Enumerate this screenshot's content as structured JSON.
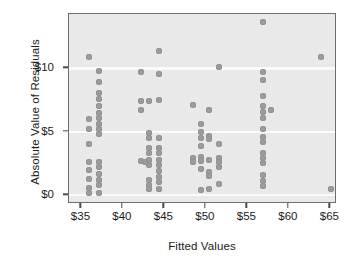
{
  "chart_data": {
    "type": "scatter",
    "title": "",
    "xlabel": "Fitted Values",
    "ylabel": "Absolute Value of Residuals",
    "xlim": [
      33.5,
      65.8
    ],
    "ylim": [
      -0.7,
      14.3
    ],
    "xticks": [
      35,
      40,
      45,
      50,
      55,
      60,
      65
    ],
    "xtick_labels": [
      "$35",
      "$40",
      "$45",
      "$50",
      "$55",
      "$60",
      "$65"
    ],
    "yticks": [
      0,
      5,
      10
    ],
    "ytick_labels": [
      "$0",
      "$5",
      "$10"
    ],
    "grid": "horizontal-white-on-gray",
    "legend": "none",
    "marker_color": "#9b9b9b",
    "plot_bg_color": "#e9e9e9",
    "frame_color": "#6d6d6d",
    "gridline_color": "#fbfbfb",
    "points": [
      [
        35.9,
        10.9
      ],
      [
        35.9,
        6.0
      ],
      [
        35.9,
        5.2
      ],
      [
        35.9,
        4.0
      ],
      [
        35.9,
        2.6
      ],
      [
        35.9,
        2.0
      ],
      [
        35.9,
        1.3
      ],
      [
        35.9,
        0.55
      ],
      [
        35.9,
        0.15
      ],
      [
        37.1,
        9.8
      ],
      [
        37.1,
        8.9
      ],
      [
        37.1,
        8.1
      ],
      [
        37.1,
        7.6
      ],
      [
        37.1,
        7.0
      ],
      [
        37.1,
        6.5
      ],
      [
        37.1,
        6.1
      ],
      [
        37.1,
        5.6
      ],
      [
        37.1,
        5.2
      ],
      [
        37.1,
        4.8
      ],
      [
        37.1,
        2.6
      ],
      [
        37.1,
        2.2
      ],
      [
        37.1,
        1.7
      ],
      [
        37.1,
        1.2
      ],
      [
        37.1,
        0.8
      ],
      [
        37.1,
        0.2
      ],
      [
        42.2,
        9.7
      ],
      [
        42.2,
        7.4
      ],
      [
        42.2,
        6.7
      ],
      [
        42.2,
        2.7
      ],
      [
        43.1,
        7.4
      ],
      [
        43.1,
        4.9
      ],
      [
        43.1,
        4.5
      ],
      [
        43.1,
        3.7
      ],
      [
        43.1,
        3.3
      ],
      [
        43.1,
        2.8
      ],
      [
        43.1,
        2.4
      ],
      [
        43.1,
        1.2
      ],
      [
        43.1,
        0.8
      ],
      [
        43.1,
        0.45
      ],
      [
        42.6,
        2.6
      ],
      [
        44.4,
        11.4
      ],
      [
        44.4,
        9.6
      ],
      [
        44.4,
        7.5
      ],
      [
        44.4,
        4.5
      ],
      [
        44.4,
        3.7
      ],
      [
        44.4,
        3.3
      ],
      [
        44.4,
        2.8
      ],
      [
        44.4,
        2.4
      ],
      [
        44.4,
        1.9
      ],
      [
        44.4,
        1.4
      ],
      [
        44.4,
        1.0
      ],
      [
        44.4,
        0.5
      ],
      [
        48.4,
        7.1
      ],
      [
        48.4,
        2.9
      ],
      [
        48.4,
        2.6
      ],
      [
        49.4,
        5.6
      ],
      [
        49.4,
        5.0
      ],
      [
        49.4,
        4.5
      ],
      [
        49.4,
        3.9
      ],
      [
        49.4,
        3.0
      ],
      [
        49.4,
        2.7
      ],
      [
        49.4,
        2.1
      ],
      [
        49.4,
        0.4
      ],
      [
        50.4,
        6.7
      ],
      [
        50.4,
        4.7
      ],
      [
        50.4,
        4.4
      ],
      [
        50.4,
        2.8
      ],
      [
        50.4,
        1.8
      ],
      [
        50.4,
        1.5
      ],
      [
        50.4,
        0.5
      ],
      [
        51.6,
        10.1
      ],
      [
        51.6,
        4.0
      ],
      [
        51.6,
        2.9
      ],
      [
        51.6,
        2.6
      ],
      [
        51.6,
        2.2
      ],
      [
        51.6,
        0.9
      ],
      [
        56.9,
        13.7
      ],
      [
        56.9,
        9.7
      ],
      [
        56.9,
        9.1
      ],
      [
        56.9,
        7.8
      ],
      [
        56.9,
        7.0
      ],
      [
        56.9,
        6.6
      ],
      [
        56.9,
        6.1
      ],
      [
        56.9,
        5.2
      ],
      [
        56.9,
        4.6
      ],
      [
        56.9,
        4.2
      ],
      [
        56.9,
        3.3
      ],
      [
        56.9,
        2.9
      ],
      [
        56.9,
        2.5
      ],
      [
        56.9,
        1.6
      ],
      [
        56.9,
        1.1
      ],
      [
        56.9,
        0.75
      ],
      [
        57.9,
        6.7
      ],
      [
        63.9,
        10.9
      ],
      [
        65.1,
        0.45
      ]
    ]
  }
}
